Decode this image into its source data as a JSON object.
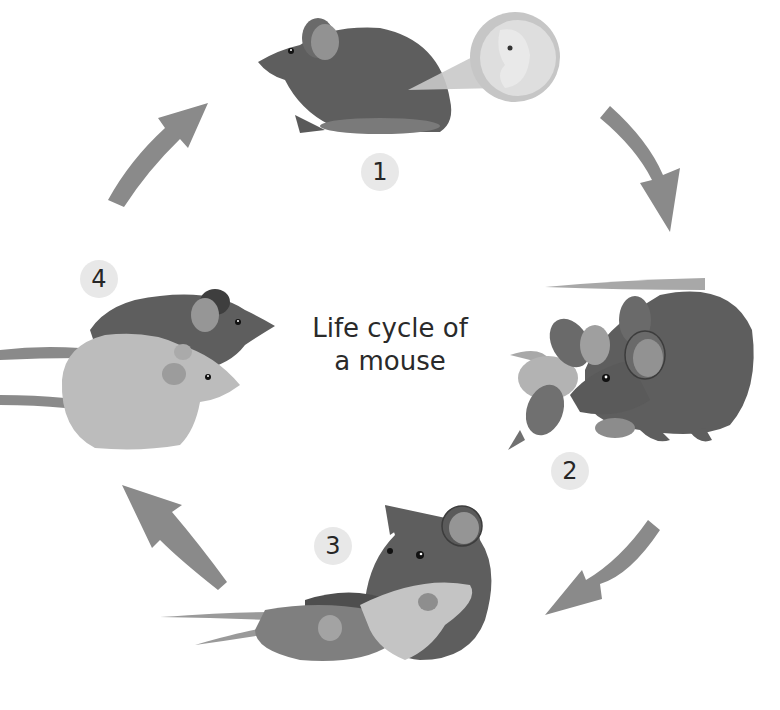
{
  "diagram": {
    "title_line1": "Life cycle of",
    "title_line2": "a mouse",
    "type": "cycle",
    "stages": [
      {
        "number": "1",
        "description": "Pregnant mouse with embryo shown in magnified circle"
      },
      {
        "number": "2",
        "description": "Mother mouse with newborn pups"
      },
      {
        "number": "3",
        "description": "Mother mouse with young mice"
      },
      {
        "number": "4",
        "description": "Two adult mice"
      }
    ],
    "colors": {
      "dark_mouse": "#5e5e5e",
      "medium_mouse": "#7d7d7d",
      "light_mouse": "#bdbdbd",
      "ear_inner": "#9a9a9a",
      "arrow": "#8a8a8a",
      "badge_bg": "#e8e8e8",
      "background": "#ffffff"
    }
  }
}
